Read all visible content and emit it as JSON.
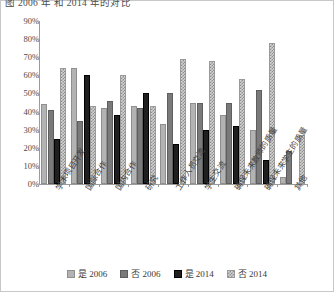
{
  "caption": "图 2006 年 和 2014 年的对比",
  "chart_data": {
    "type": "bar",
    "title": "",
    "subtitle": "",
    "xlabel": "",
    "ylabel": "",
    "ylim": [
      0,
      90
    ],
    "ytick_labels": [
      "0%",
      "10%",
      "20%",
      "30%",
      "40%",
      "50%",
      "60%",
      "70%",
      "80%",
      "90%"
    ],
    "ytick_values": [
      0,
      10,
      20,
      30,
      40,
      50,
      60,
      70,
      80,
      90
    ],
    "grid": false,
    "legend_position": "bottom",
    "value_suffix": "%",
    "categories": [
      "学术项目开发",
      "国际合作",
      "国内合作",
      "研究",
      "工作人员交流",
      "学生交流",
      "确保未来教师的质量",
      "确保未来学生的质量",
      "其他"
    ],
    "series": [
      {
        "name": "是 2006",
        "color": "#b3b3b3",
        "pattern": "solid-light",
        "values": [
          44,
          64,
          42,
          43,
          33,
          45,
          38,
          30,
          4
        ]
      },
      {
        "name": "否 2006",
        "color": "#7a7a7a",
        "pattern": "solid-medium",
        "values": [
          41,
          35,
          46,
          42,
          50,
          45,
          45,
          52,
          18
        ]
      },
      {
        "name": "是 2014",
        "color": "#1f1f1f",
        "pattern": "solid-dark",
        "values": [
          25,
          60,
          38,
          50,
          22,
          30,
          32,
          13,
          0
        ]
      },
      {
        "name": "否 2014",
        "color": "#d2d2d2",
        "pattern": "checker",
        "values": [
          64,
          43,
          60,
          43,
          69,
          68,
          58,
          78,
          27
        ]
      }
    ]
  },
  "legend": {
    "items": [
      {
        "label": "是 2006"
      },
      {
        "label": "否 2006"
      },
      {
        "label": "是 2014"
      },
      {
        "label": "否 2014"
      }
    ]
  }
}
